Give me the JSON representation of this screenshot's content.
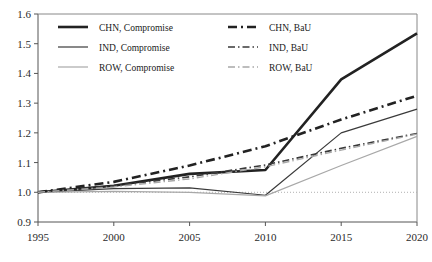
{
  "chart_data": {
    "type": "line",
    "title": "",
    "subtitle": "",
    "xlabel": "",
    "ylabel": "",
    "x": [
      1995,
      2000,
      2005,
      2010,
      2015,
      2020
    ],
    "xlim": [
      1995,
      2020
    ],
    "ylim": [
      0.9,
      1.6
    ],
    "xticks": [
      "1995",
      "2000",
      "2005",
      "2010",
      "2015",
      "2020"
    ],
    "yticks": [
      "0.9",
      "1.0",
      "1.1",
      "1.2",
      "1.3",
      "1.4",
      "1.5",
      "1.6"
    ],
    "grid": false,
    "legend_position": "top-left",
    "reference_line": {
      "value": 1.0,
      "style": "dotted",
      "color": "#b0b0b0"
    },
    "series": [
      {
        "name": "CHN, Compromise",
        "values": [
          1.0,
          1.022,
          1.062,
          1.075,
          1.38,
          1.535
        ],
        "style": "solid",
        "color": "#222222",
        "width": 2.6
      },
      {
        "name": "IND, Compromise",
        "values": [
          1.0,
          1.012,
          1.015,
          0.99,
          1.2,
          1.28
        ],
        "style": "solid",
        "color": "#3a3a3a",
        "width": 1.2
      },
      {
        "name": "ROW, Compromise",
        "values": [
          1.0,
          1.003,
          1.0,
          0.988,
          1.09,
          1.188
        ],
        "style": "solid",
        "color": "#a8a8a8",
        "width": 1.2
      },
      {
        "name": "CHN, BaU",
        "values": [
          1.0,
          1.035,
          1.09,
          1.155,
          1.245,
          1.325
        ],
        "style": "dashed",
        "color": "#222222",
        "width": 2.6
      },
      {
        "name": "IND, BaU",
        "values": [
          1.0,
          1.022,
          1.052,
          1.092,
          1.148,
          1.198
        ],
        "style": "dashed",
        "color": "#3a3a3a",
        "width": 1.6
      },
      {
        "name": "ROW, BaU",
        "values": [
          1.0,
          1.018,
          1.045,
          1.086,
          1.142,
          1.196
        ],
        "style": "dashed",
        "color": "#a8a8a8",
        "width": 1.4
      }
    ]
  },
  "legend": {
    "entries": [
      {
        "label": "CHN, Compromise"
      },
      {
        "label": "IND, Compromise"
      },
      {
        "label": "ROW, Compromise"
      },
      {
        "label": "CHN, BaU"
      },
      {
        "label": "IND, BaU"
      },
      {
        "label": "ROW, BaU"
      }
    ]
  },
  "axes": {
    "y_tick_labels": [
      "1.6",
      "1.5",
      "1.4",
      "1.3",
      "1.2",
      "1.1",
      "1.0",
      "0.9"
    ],
    "x_tick_labels": [
      "1995",
      "2000",
      "2005",
      "2010",
      "2015",
      "2020"
    ]
  }
}
